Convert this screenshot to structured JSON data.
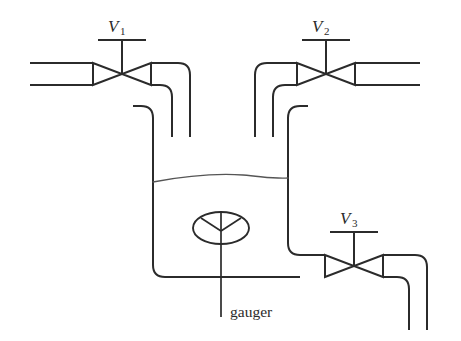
{
  "diagram": {
    "type": "piping-instrumentation-diagram",
    "background_color": "#ffffff",
    "line_color": "#2b2b2b",
    "liquid_line_color": "#555555",
    "valves": [
      {
        "id": "V1",
        "label_main": "V",
        "label_sub": "1",
        "position": "top-left",
        "role": "inlet-valve"
      },
      {
        "id": "V2",
        "label_main": "V",
        "label_sub": "2",
        "position": "top-right",
        "role": "inlet-valve"
      },
      {
        "id": "V3",
        "label_main": "V",
        "label_sub": "3",
        "position": "bottom-right",
        "role": "outlet-valve"
      }
    ],
    "instruments": [
      {
        "id": "gauger",
        "label": "gauger",
        "shape": "ellipse-with-y-spokes",
        "role": "level-gauge"
      }
    ],
    "tank": {
      "name": "vessel",
      "has_liquid_surface": true,
      "liquid_surface_style": "wavy-line"
    },
    "icon_names": {
      "valve": "gate-valve-icon",
      "gauge": "gauge-icon",
      "pipe": "pipe-line"
    }
  }
}
